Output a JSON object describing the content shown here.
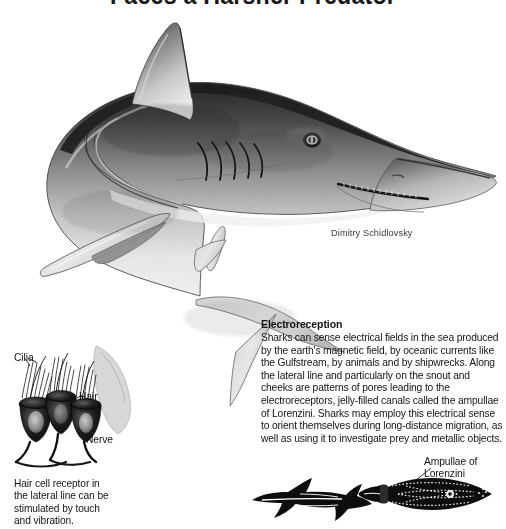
{
  "title": "Faces a Harsher Predator",
  "credit": "Dimitry Schidlovsky",
  "electroreception": {
    "heading": "Electroreception",
    "body": "Sharks can sense electrical fields in the sea produced by the earth's magnetic field, by oceanic currents like the Gulfstream, by animals and by shipwrecks. Along the lateral line and particularly on the snout and cheeks are patterns of pores leading to the electroreceptors, jelly-filled canals called the ampullae of Lorenzini. Sharks may employ this electrical sense to orient themselves during long-distance migration, as well as using it to investigate prey and metallic objects."
  },
  "labels": {
    "cilia": "Cilia",
    "hair_cell": "Hair cell",
    "nerve": "Nerve",
    "ampullae": "Ampullae of Lorenzini"
  },
  "hair_cell_note": "Hair cell receptor in the lateral line can be stimulated by touch and vibration.",
  "figures": {
    "main_shark": "shark-lateral-illustration",
    "hair_cell_detail": "hair-cell-receptor-diagram",
    "shark_silhouette": "shark-body-silhouette",
    "shark_head_pores": "shark-head-ampullae-diagram"
  },
  "colors": {
    "background": "#ffffff",
    "text": "#141414",
    "ink": "#1a1a1a"
  }
}
